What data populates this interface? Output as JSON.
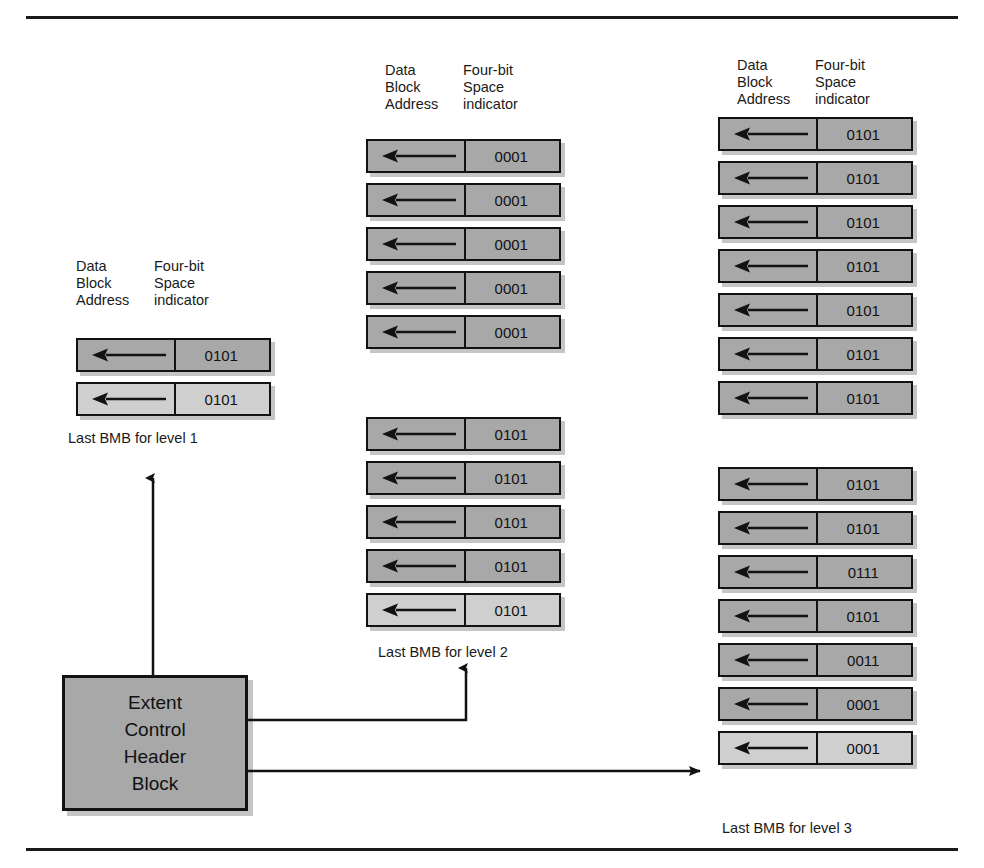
{
  "figure": {
    "title_rules": {
      "top": true,
      "bottom": true
    }
  },
  "headers": {
    "address": "Data\nBlock\nAddress",
    "space": "Four-bit\nSpace\nindicator"
  },
  "levels": [
    {
      "id": "level-1",
      "caption": "Last  BMB  for level 1",
      "groups": [
        {
          "rows": [
            {
              "arrow": "left-arrow-icon",
              "value": "0101",
              "last": false
            },
            {
              "arrow": "left-arrow-icon",
              "value": "0101",
              "last": true
            }
          ]
        }
      ]
    },
    {
      "id": "level-2",
      "caption": "Last  BMB  for level 2",
      "groups": [
        {
          "rows": [
            {
              "arrow": "left-arrow-icon",
              "value": "0001",
              "last": false
            },
            {
              "arrow": "left-arrow-icon",
              "value": "0001",
              "last": false
            },
            {
              "arrow": "left-arrow-icon",
              "value": "0001",
              "last": false
            },
            {
              "arrow": "left-arrow-icon",
              "value": "0001",
              "last": false
            },
            {
              "arrow": "left-arrow-icon",
              "value": "0001",
              "last": false
            }
          ]
        },
        {
          "rows": [
            {
              "arrow": "left-arrow-icon",
              "value": "0101",
              "last": false
            },
            {
              "arrow": "left-arrow-icon",
              "value": "0101",
              "last": false
            },
            {
              "arrow": "left-arrow-icon",
              "value": "0101",
              "last": false
            },
            {
              "arrow": "left-arrow-icon",
              "value": "0101",
              "last": false
            },
            {
              "arrow": "left-arrow-icon",
              "value": "0101",
              "last": true
            }
          ]
        }
      ]
    },
    {
      "id": "level-3",
      "caption": "Last  BMB  for level 3",
      "groups": [
        {
          "rows": [
            {
              "arrow": "left-arrow-icon",
              "value": "0101",
              "last": false
            },
            {
              "arrow": "left-arrow-icon",
              "value": "0101",
              "last": false
            },
            {
              "arrow": "left-arrow-icon",
              "value": "0101",
              "last": false
            },
            {
              "arrow": "left-arrow-icon",
              "value": "0101",
              "last": false
            },
            {
              "arrow": "left-arrow-icon",
              "value": "0101",
              "last": false
            },
            {
              "arrow": "left-arrow-icon",
              "value": "0101",
              "last": false
            },
            {
              "arrow": "left-arrow-icon",
              "value": "0101",
              "last": false
            }
          ]
        },
        {
          "rows": [
            {
              "arrow": "left-arrow-icon",
              "value": "0101",
              "last": false
            },
            {
              "arrow": "left-arrow-icon",
              "value": "0101",
              "last": false
            },
            {
              "arrow": "left-arrow-icon",
              "value": "0111",
              "last": false
            },
            {
              "arrow": "left-arrow-icon",
              "value": "0101",
              "last": false
            },
            {
              "arrow": "left-arrow-icon",
              "value": "0011",
              "last": false
            },
            {
              "arrow": "left-arrow-icon",
              "value": "0001",
              "last": false
            },
            {
              "arrow": "left-arrow-icon",
              "value": "0001",
              "last": true
            }
          ]
        }
      ]
    }
  ],
  "extent_control_header_block": {
    "lines": [
      "Extent",
      "Control",
      "Header",
      "Block"
    ]
  },
  "colors": {
    "block_fill": "#a8a8a8",
    "block_fill_last": "#cfcfcf",
    "stroke": "#121212",
    "background": "#ffffff"
  }
}
